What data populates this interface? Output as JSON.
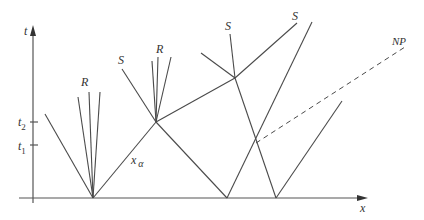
{
  "diagram": {
    "type": "space-time wave interaction diagram",
    "axes": {
      "x_label": "x",
      "t_label": "t",
      "t_ticks": [
        {
          "label": "t",
          "sub": "2"
        },
        {
          "label": "t",
          "sub": "1"
        }
      ]
    },
    "labels": {
      "rarefaction_left": "R",
      "shock_left": "S",
      "rarefaction_mid": "R",
      "shock_top_mid": "S",
      "shock_top_right": "S",
      "new_path": "NP",
      "x_alpha_main": "x",
      "x_alpha_sub": "α"
    },
    "colors": {
      "line": "#4a4a4a",
      "axis": "#555555",
      "background": "#ffffff"
    }
  }
}
